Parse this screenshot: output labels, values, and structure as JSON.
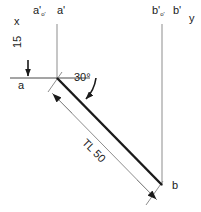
{
  "drawing": {
    "type": "descriptive-geometry-line-projection",
    "axes": {
      "x_label": "x",
      "y_label": "y"
    },
    "labels": {
      "a_front_aux": "a'",
      "a_front_aux_sub": "o'",
      "a_front": "a'",
      "b_front_aux": "b'",
      "b_front_aux_sub": "o'",
      "b_front": "b'",
      "a_top": "a",
      "b_top": "b"
    },
    "dimensions": {
      "offset_label": "15",
      "angle_label": "30°",
      "true_length_label": "TL 50"
    },
    "colors": {
      "ink": "#1a1a1a",
      "thin_line": "#8d8d8d",
      "background": "#ffffff"
    },
    "geometry": {
      "point_a": [
        57,
        78
      ],
      "point_b": [
        162,
        185
      ],
      "ground_line_y": 78,
      "ground_line_x1": 10,
      "ground_line_x2": 90
    }
  }
}
